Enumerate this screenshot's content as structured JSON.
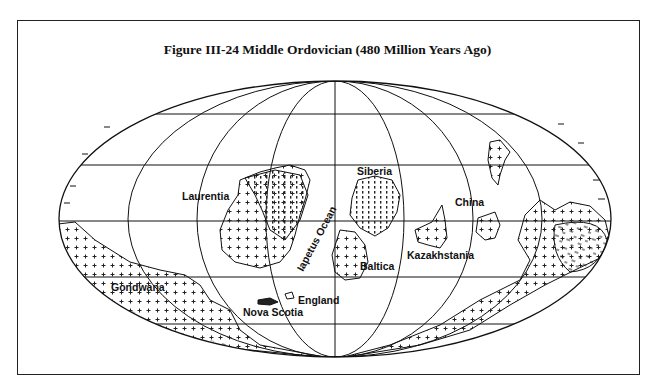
{
  "figure": {
    "title": "Figure III-24  Middle Ordovician (480 Million Years Ago)"
  },
  "map": {
    "projection": "mollweide-style ellipse",
    "ellipse": {
      "cx": 335,
      "cy": 219,
      "rx": 276,
      "ry": 138
    },
    "parallels_y": [
      114,
      165,
      221,
      277,
      324
    ],
    "labels": {
      "laurentia": "Laurentia",
      "siberia": "Siberia",
      "china": "China",
      "kazakhstania": "Kazakhstania",
      "baltica": "Baltica",
      "iapetus_ocean": "Iapetus Ocean",
      "england": "England",
      "nova_scotia": "Nova Scotia",
      "gondwana": "Gondwana"
    }
  }
}
